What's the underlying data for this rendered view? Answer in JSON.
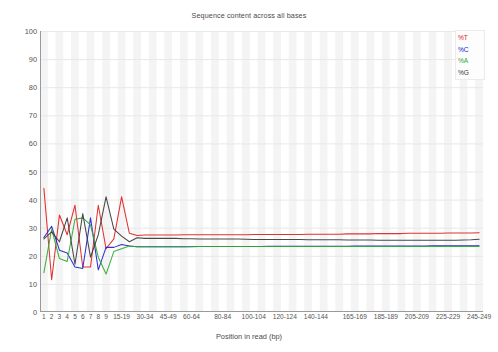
{
  "chart_data": {
    "type": "line",
    "title": "Sequence content across all bases",
    "xlabel": "Position in read (bp)",
    "ylabel": "",
    "ylim": [
      0,
      100
    ],
    "ytick_labels": [
      "100",
      "90",
      "80",
      "70",
      "60",
      "50",
      "40",
      "30",
      "20",
      "10",
      "0"
    ],
    "ytick_values": [
      100,
      90,
      80,
      70,
      60,
      50,
      40,
      30,
      20,
      10,
      0
    ],
    "grid": true,
    "legend_position": "top-right",
    "categories": [
      "1",
      "2",
      "3",
      "4",
      "5",
      "6",
      "7",
      "8",
      "9",
      "10-14",
      "15-19",
      "20-24",
      "25-29",
      "30-34",
      "35-39",
      "40-44",
      "45-49",
      "50-54",
      "55-59",
      "60-64",
      "65-69",
      "70-74",
      "75-79",
      "80-84",
      "85-89",
      "90-94",
      "95-99",
      "100-104",
      "105-109",
      "110-114",
      "115-119",
      "120-124",
      "125-129",
      "130-134",
      "135-139",
      "140-144",
      "145-149",
      "150-154",
      "155-159",
      "160-164",
      "165-169",
      "170-174",
      "175-179",
      "180-184",
      "185-189",
      "190-194",
      "195-199",
      "200-204",
      "205-209",
      "210-214",
      "215-219",
      "220-224",
      "225-229",
      "230-234",
      "235-239",
      "240-244",
      "245-249"
    ],
    "xtick_labels": [
      "1",
      "2",
      "3",
      "4",
      "5",
      "6",
      "7",
      "8",
      "9",
      "15-19",
      "30-34",
      "45-49",
      "60-64",
      "80-84",
      "100-104",
      "120-124",
      "140-144",
      "165-169",
      "185-189",
      "205-209",
      "225-229",
      "245-249"
    ],
    "xtick_indices": [
      0,
      1,
      2,
      3,
      4,
      5,
      6,
      7,
      8,
      10,
      13,
      16,
      19,
      23,
      27,
      31,
      35,
      40,
      44,
      48,
      52,
      56
    ],
    "series": [
      {
        "name": "%T",
        "color": "#e02020",
        "values": [
          44.0,
          11.5,
          34.5,
          27.5,
          38.0,
          16.0,
          16.0,
          38.0,
          22.5,
          26.0,
          41.0,
          28.0,
          27.2,
          27.4,
          27.4,
          27.4,
          27.4,
          27.4,
          27.5,
          27.5,
          27.5,
          27.5,
          27.5,
          27.5,
          27.5,
          27.5,
          27.5,
          27.6,
          27.6,
          27.6,
          27.6,
          27.6,
          27.6,
          27.6,
          27.7,
          27.7,
          27.7,
          27.7,
          27.7,
          27.8,
          27.8,
          27.8,
          27.8,
          27.9,
          27.9,
          27.9,
          27.9,
          28.0,
          28.0,
          28.0,
          28.0,
          28.0,
          28.1,
          28.1,
          28.1,
          28.1,
          28.2
        ]
      },
      {
        "name": "%C",
        "color": "#2020d0",
        "values": [
          26.5,
          30.5,
          22.0,
          21.0,
          16.0,
          15.5,
          33.5,
          15.0,
          23.0,
          23.0,
          24.0,
          23.5,
          23.2,
          23.2,
          23.2,
          23.2,
          23.2,
          23.2,
          23.2,
          23.2,
          23.3,
          23.3,
          23.3,
          23.3,
          23.3,
          23.3,
          23.3,
          23.3,
          23.3,
          23.4,
          23.4,
          23.4,
          23.4,
          23.4,
          23.4,
          23.4,
          23.4,
          23.4,
          23.4,
          23.4,
          23.5,
          23.5,
          23.5,
          23.5,
          23.5,
          23.5,
          23.5,
          23.5,
          23.5,
          23.5,
          23.6,
          23.6,
          23.6,
          23.6,
          23.6,
          23.6,
          23.6
        ]
      },
      {
        "name": "%A",
        "color": "#2ea82e",
        "values": [
          14.0,
          29.5,
          19.0,
          18.0,
          33.0,
          33.5,
          31.0,
          19.5,
          13.5,
          21.5,
          22.5,
          23.5,
          23.2,
          23.2,
          23.2,
          23.2,
          23.2,
          23.2,
          23.2,
          23.3,
          23.3,
          23.3,
          23.3,
          23.3,
          23.3,
          23.3,
          23.3,
          23.3,
          23.3,
          23.3,
          23.3,
          23.3,
          23.3,
          23.3,
          23.3,
          23.3,
          23.3,
          23.3,
          23.3,
          23.3,
          23.3,
          23.3,
          23.3,
          23.3,
          23.3,
          23.3,
          23.3,
          23.3,
          23.3,
          23.3,
          23.3,
          23.3,
          23.3,
          23.3,
          23.3,
          23.3,
          23.3
        ]
      },
      {
        "name": "%G",
        "color": "#3a3a3a",
        "values": [
          26.0,
          28.5,
          25.0,
          33.5,
          17.0,
          35.0,
          19.5,
          27.5,
          41.0,
          29.5,
          27.0,
          25.0,
          26.4,
          26.2,
          26.2,
          26.2,
          26.2,
          26.2,
          26.1,
          26.1,
          26.0,
          26.0,
          26.0,
          26.0,
          26.0,
          26.0,
          25.9,
          25.8,
          25.8,
          25.8,
          25.8,
          25.8,
          25.8,
          25.8,
          25.7,
          25.7,
          25.7,
          25.7,
          25.7,
          25.6,
          25.6,
          25.6,
          25.6,
          25.5,
          25.5,
          25.5,
          25.5,
          25.5,
          25.5,
          25.5,
          25.5,
          25.5,
          25.5,
          25.5,
          25.6,
          25.7,
          25.9
        ]
      }
    ],
    "legend": [
      {
        "label": "%T",
        "color": "#e02020"
      },
      {
        "label": "%C",
        "color": "#2020d0"
      },
      {
        "label": "%A",
        "color": "#2ea82e"
      },
      {
        "label": "%G",
        "color": "#3a3a3a"
      }
    ],
    "colors": {
      "grid": "#e8e8e8",
      "axis": "#9a9a9a",
      "band": "#f4f4f4",
      "background": "#ffffff"
    }
  }
}
